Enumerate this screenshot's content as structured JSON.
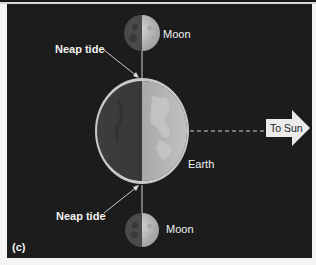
{
  "figure": {
    "panel_label": "(c)",
    "labels": {
      "moon_top": "Moon",
      "moon_bottom": "Moon",
      "neap_tide_top": "Neap tide",
      "neap_tide_bottom": "Neap tide",
      "earth": "Earth",
      "sun_arrow": "To Sun"
    },
    "colors": {
      "background": "#1c1c1c",
      "label_text": "#f2f2f2",
      "arrow_fill": "#ebebeb",
      "ocean_bulge": "#c9c9c9",
      "earth_dark": "#3a3a3a",
      "earth_lit": "#b5b5b5",
      "moon_dark": "#4a4a4a",
      "moon_lit": "#c8c8c8"
    }
  }
}
